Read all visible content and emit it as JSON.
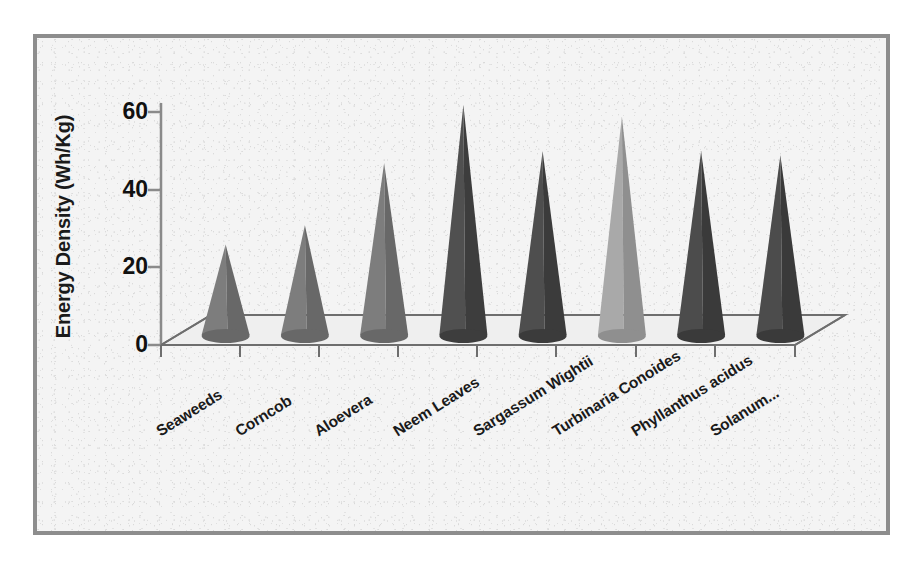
{
  "figure": {
    "frame_color": "#8d8d8d",
    "background_color": "#f4f4f4"
  },
  "chart_data": {
    "type": "bar",
    "title": "",
    "subtitle": "",
    "xlabel": "",
    "ylabel": "Energy Density (Wh/Kg)",
    "ylim": [
      0,
      60
    ],
    "yticks": [
      0,
      20,
      40,
      60
    ],
    "ytick_labels": [
      "0",
      "20",
      "40",
      "60"
    ],
    "grid": false,
    "legend": null,
    "style": "3d-cone",
    "categories": [
      "Seaweeds",
      "Corncob",
      "Aloevera",
      "Neem Leaves",
      "Sargassum Wightii",
      "Turbinaria Conoides",
      "Phyllanthus acidus",
      "Solanum..."
    ],
    "values": [
      22,
      27,
      43,
      58,
      46,
      55,
      46,
      45
    ],
    "bar_colors": [
      "#7d7d7d",
      "#7d7d7d",
      "#7d7d7d",
      "#505050",
      "#4e4e4e",
      "#a9a9a9",
      "#4c4c4c",
      "#4c4c4c"
    ],
    "bar_colors_shadow": [
      "#686868",
      "#686868",
      "#686868",
      "#3d3d3d",
      "#3b3b3b",
      "#8f8f8f",
      "#3a3a3a",
      "#3a3a3a"
    ]
  },
  "axes": {
    "axis_line_color": "#6e6e6e",
    "floor_color": "#efefef"
  }
}
